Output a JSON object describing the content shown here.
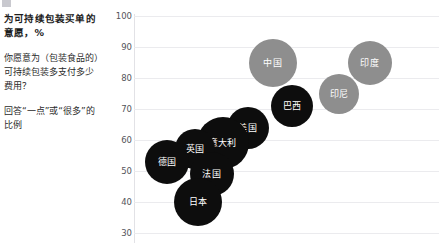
{
  "top_strip": {
    "icon": "square-marker-icon",
    "ghost_text": "",
    "ghost_text2": ""
  },
  "sidebar": {
    "title": "为可持续包装买单的意愿，%",
    "question": "你愿意为（包装食品的）可持续包装多支付多少费用？",
    "note": "回答“一点”或“很多”的比例"
  },
  "chart_data": {
    "type": "scatter",
    "title": "为可持续包装买单的意愿，%",
    "xlabel": "",
    "ylabel": "",
    "ylim": [
      30,
      100
    ],
    "yticks": [
      100,
      90,
      80,
      70,
      60,
      50,
      40,
      30
    ],
    "grid": true,
    "legend": "none",
    "colors": {
      "developed": "#0d0d0d",
      "emerging": "#8e8e8e",
      "gridline": "#ebebee",
      "axis": "#e2e2e6",
      "label_text": "#ffffff"
    },
    "points": [
      {
        "label": "中国",
        "x": 45,
        "y": 85,
        "size": 24,
        "group": "emerging"
      },
      {
        "label": "印度",
        "x": 80,
        "y": 85,
        "size": 22,
        "group": "emerging"
      },
      {
        "label": "印尼",
        "x": 69,
        "y": 75,
        "size": 20,
        "group": "emerging"
      },
      {
        "label": "巴西",
        "x": 52,
        "y": 71,
        "size": 21,
        "group": "developed"
      },
      {
        "label": "美国",
        "x": 36,
        "y": 64,
        "size": 21,
        "group": "developed"
      },
      {
        "label": "意大利",
        "x": 27,
        "y": 59,
        "size": 26,
        "group": "developed"
      },
      {
        "label": "英国",
        "x": 17,
        "y": 57,
        "size": 20,
        "group": "developed"
      },
      {
        "label": "德国",
        "x": 7,
        "y": 53,
        "size": 22,
        "group": "developed"
      },
      {
        "label": "法国",
        "x": 23,
        "y": 49,
        "size": 22,
        "group": "developed"
      },
      {
        "label": "日本",
        "x": 18,
        "y": 40,
        "size": 24,
        "group": "developed"
      }
    ]
  }
}
